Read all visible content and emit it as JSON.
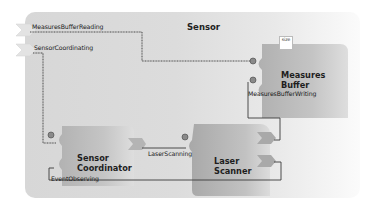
{
  "diagram": {
    "container": {
      "name": "Sensor",
      "external_ports": [
        {
          "label": "MeasuresBufferReading"
        },
        {
          "label": "SensorCoordinating"
        }
      ]
    },
    "components": [
      {
        "id": "measures-buffer",
        "name_line1": "Measures",
        "name_line2": "Buffer",
        "attribute": "size",
        "ports": [
          {
            "label": "MeasuresBufferWriting"
          }
        ]
      },
      {
        "id": "sensor-coordinator",
        "name_line1": "Sensor",
        "name_line2": "Coordinator",
        "ports": [
          {
            "label": "EventObserving"
          }
        ]
      },
      {
        "id": "laser-scanner",
        "name_line1": "Laser",
        "name_line2": "Scanner",
        "ports": [
          {
            "label": "LaserScanning"
          }
        ]
      }
    ],
    "colors": {
      "container_bg": "#d9d9d9",
      "component_bg": "#b5b5b5",
      "connector": "#444444",
      "text": "#1e1e1e"
    }
  }
}
